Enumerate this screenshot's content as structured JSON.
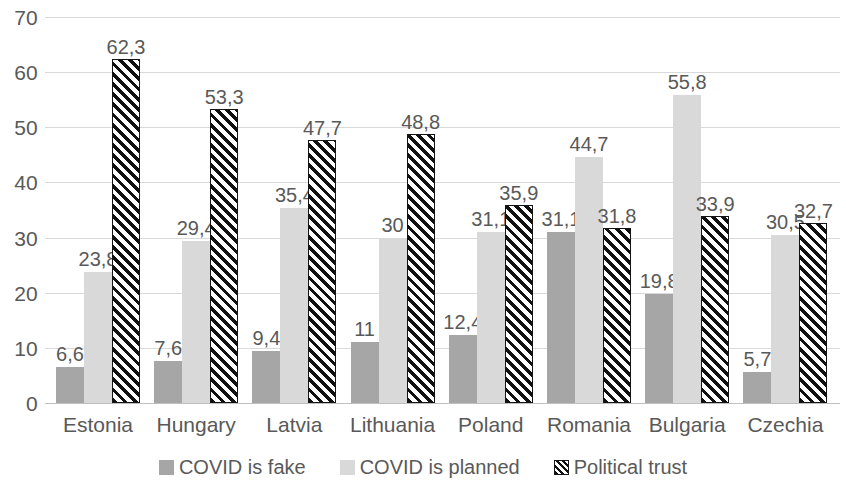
{
  "chart_data": {
    "type": "bar",
    "title": "",
    "subtitle": "",
    "xlabel": "",
    "ylabel": "",
    "ylim": [
      0,
      70
    ],
    "ytick_step": 10,
    "yticks": [
      "70",
      "60",
      "50",
      "40",
      "30",
      "20",
      "10",
      "0"
    ],
    "grid": true,
    "legend_position": "bottom",
    "decimal_separator": ",",
    "categories": [
      "Estonia",
      "Hungary",
      "Latvia",
      "Lithuania",
      "Poland",
      "Romania",
      "Bulgaria",
      "Czechia"
    ],
    "series": [
      {
        "name": "COVID is fake",
        "color": "#a6a6a6",
        "fill": "solid",
        "values": [
          6.6,
          7.6,
          9.4,
          11,
          12.4,
          31.1,
          19.8,
          5.7
        ],
        "labels": [
          "6,6",
          "7,6",
          "9,4",
          "11",
          "12,4",
          "31,1",
          "19,8",
          "5,7"
        ]
      },
      {
        "name": "COVID is planned",
        "color": "#d9d9d9",
        "fill": "solid",
        "values": [
          23.8,
          29.4,
          35.4,
          30,
          31.1,
          44.7,
          55.8,
          30.5
        ],
        "labels": [
          "23,8",
          "29,4",
          "35,4",
          "30",
          "31,1",
          "44,7",
          "55,8",
          "30,5"
        ]
      },
      {
        "name": "Political trust",
        "color": "#111111",
        "fill": "diagonal-hatch",
        "values": [
          62.3,
          53.3,
          47.7,
          48.8,
          35.9,
          31.8,
          33.9,
          32.7
        ],
        "labels": [
          "62,3",
          "53,3",
          "47,7",
          "48,8",
          "35,9",
          "31,8",
          "33,9",
          "32,7"
        ]
      }
    ]
  },
  "legend": {
    "items": [
      {
        "label": "COVID is fake"
      },
      {
        "label": "COVID is planned"
      },
      {
        "label": "Political trust"
      }
    ]
  }
}
